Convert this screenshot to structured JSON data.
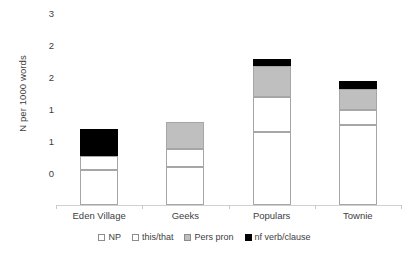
{
  "chart_data": {
    "type": "bar",
    "stacked": true,
    "title": "",
    "xlabel": "",
    "ylabel": "N per 1000 words",
    "categories": [
      "Eden Village",
      "Geeks",
      "Populars",
      "Townie"
    ],
    "series": [
      {
        "name": "NP",
        "color": "#ffffff",
        "values": [
          0.55,
          0.6,
          1.15,
          1.25
        ]
      },
      {
        "name": "this/that",
        "color": "#ffffff",
        "values": [
          0.22,
          0.28,
          0.55,
          0.25
        ]
      },
      {
        "name": "Pers pron",
        "color": "#bfbfbf",
        "values": [
          0.0,
          0.42,
          0.48,
          0.32
        ]
      },
      {
        "name": "nf verb/clause",
        "color": "#000000",
        "values": [
          0.43,
          0.0,
          0.12,
          0.13
        ]
      }
    ],
    "totals": [
      1.2,
      1.3,
      2.3,
      1.95
    ],
    "ylim": [
      0,
      3
    ],
    "yticks": [
      0,
      0.5,
      1,
      1.5,
      2,
      2.5,
      3
    ],
    "ytick_labels": [
      "0",
      "1",
      "1",
      "2",
      "2",
      "3"
    ],
    "grid": false,
    "legend_position": "bottom"
  },
  "axis": {
    "y_title": "N per 1000 words",
    "y_ticks": [
      {
        "label": "3",
        "value": 3.0
      },
      {
        "label": "2",
        "value": 2.5
      },
      {
        "label": "2",
        "value": 2.0
      },
      {
        "label": "1",
        "value": 1.5
      },
      {
        "label": "1",
        "value": 1.0
      },
      {
        "label": "0",
        "value": 0.5
      }
    ],
    "categories": [
      "Eden Village",
      "Geeks",
      "Populars",
      "Townie"
    ]
  },
  "legend": {
    "items": [
      {
        "label": "NP",
        "color": "#ffffff"
      },
      {
        "label": "this/that",
        "color": "#ffffff"
      },
      {
        "label": "Pers pron",
        "color": "#bfbfbf"
      },
      {
        "label": "nf verb/clause",
        "color": "#000000"
      }
    ]
  }
}
